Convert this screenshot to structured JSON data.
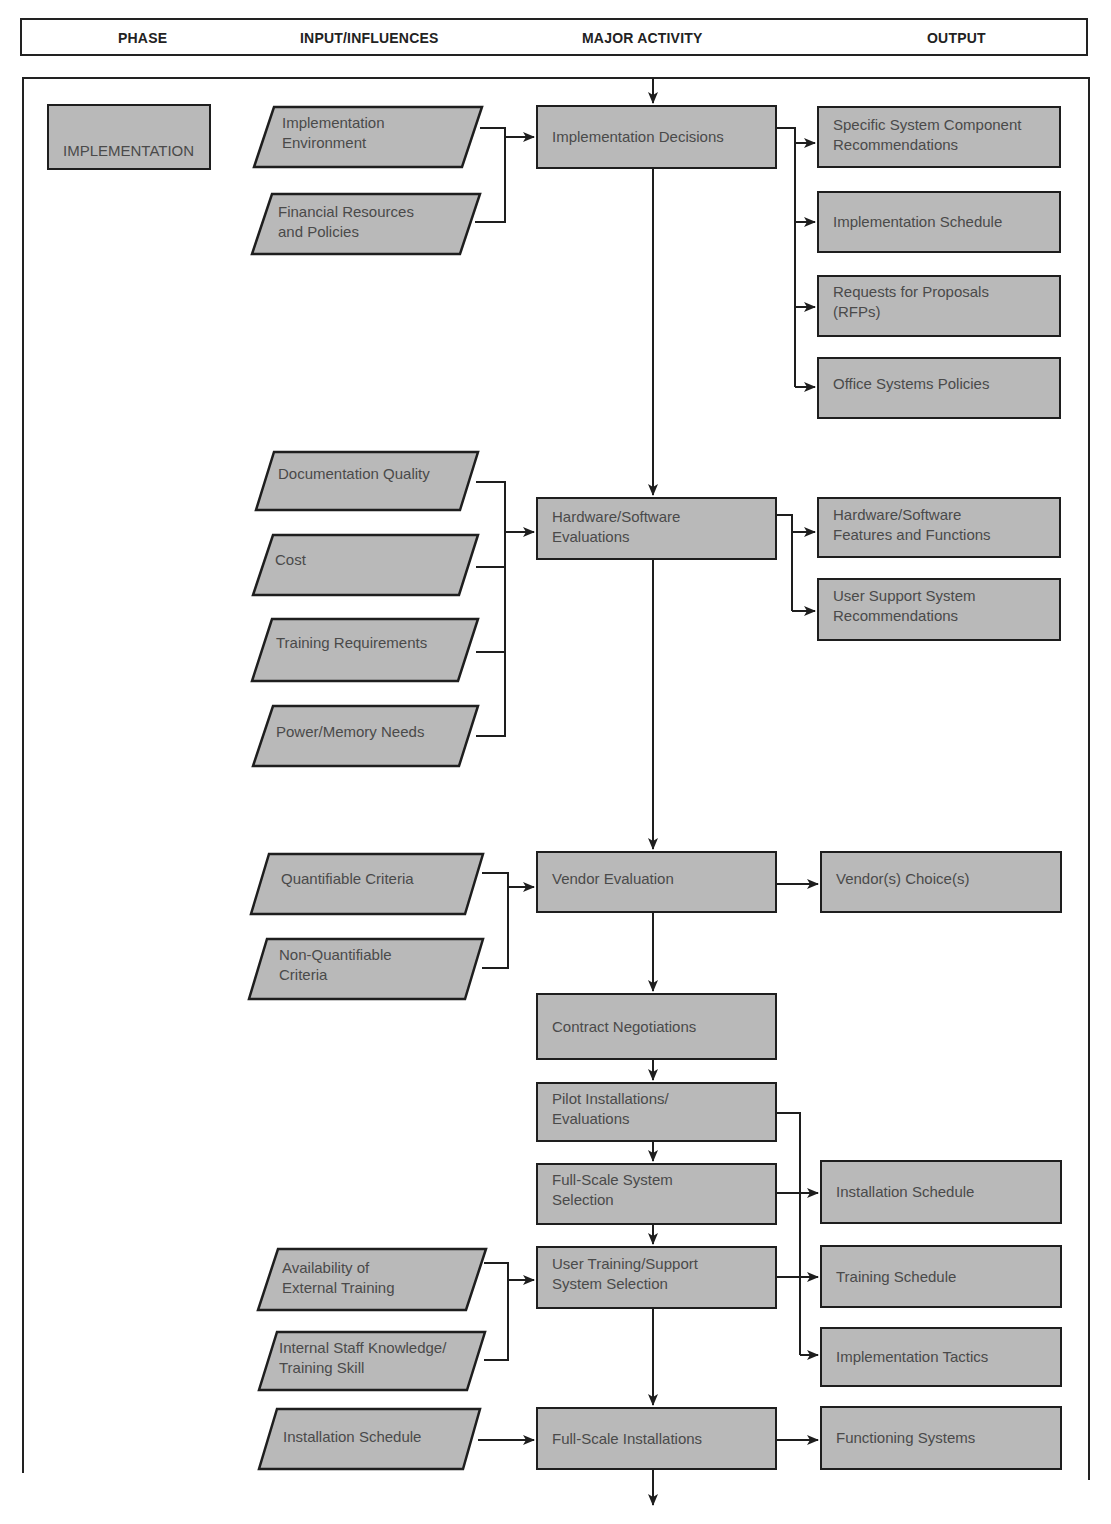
{
  "header": {
    "phase": "PHASE",
    "inputs": "INPUT/INFLUENCES",
    "activity": "MAJOR ACTIVITY",
    "output": "OUTPUT"
  },
  "phase_label": "IMPLEMENTATION",
  "colors": {
    "box_fill": "#b9b9b9",
    "stroke": "#1e1e1e",
    "text": "#4a4a4a"
  },
  "activities": [
    {
      "id": "implementation-decisions",
      "label": "Implementation Decisions"
    },
    {
      "id": "hardware-software-evaluations",
      "label": "Hardware/Software\nEvaluations"
    },
    {
      "id": "vendor-evaluation",
      "label": "Vendor Evaluation"
    },
    {
      "id": "contract-negotiations",
      "label": "Contract Negotiations"
    },
    {
      "id": "pilot-installations-evaluations",
      "label": "Pilot Installations/\nEvaluations"
    },
    {
      "id": "full-scale-system-selection",
      "label": "Full-Scale System\nSelection"
    },
    {
      "id": "user-training-support-system-selection",
      "label": "User Training/Support\nSystem Selection"
    },
    {
      "id": "full-scale-installations",
      "label": "Full-Scale Installations"
    }
  ],
  "inputs": [
    {
      "id": "implementation-environment",
      "label": "Implementation\nEnvironment"
    },
    {
      "id": "financial-resources-and-policies",
      "label": "Financial Resources\nand Policies"
    },
    {
      "id": "documentation-quality",
      "label": "Documentation Quality"
    },
    {
      "id": "cost",
      "label": "Cost"
    },
    {
      "id": "training-requirements",
      "label": "Training Requirements"
    },
    {
      "id": "power-memory-needs",
      "label": "Power/Memory Needs"
    },
    {
      "id": "quantifiable-criteria",
      "label": "Quantifiable Criteria"
    },
    {
      "id": "non-quantifiable-criteria",
      "label": "Non-Quantifiable\nCriteria"
    },
    {
      "id": "availability-of-external-training",
      "label": "Availability of\nExternal Training"
    },
    {
      "id": "internal-staff-knowledge",
      "label": "Internal Staff Knowledge/\nTraining  Skill"
    },
    {
      "id": "installation-schedule-input",
      "label": "Installation Schedule"
    }
  ],
  "outputs": [
    {
      "id": "specific-system-component-recommendations",
      "label": "Specific System Component\nRecommendations"
    },
    {
      "id": "implementation-schedule",
      "label": "Implementation Schedule"
    },
    {
      "id": "requests-for-proposals",
      "label": "Requests for Proposals\n(RFPs)"
    },
    {
      "id": "office-systems-policies",
      "label": "Office Systems Policies"
    },
    {
      "id": "hardware-software-features-and-functions",
      "label": "Hardware/Software\nFeatures and Functions"
    },
    {
      "id": "user-support-system-recommendations",
      "label": "User Support System\nRecommendations"
    },
    {
      "id": "vendors-choices",
      "label": "Vendor(s) Choice(s)"
    },
    {
      "id": "installation-schedule-output",
      "label": "Installation Schedule"
    },
    {
      "id": "training-schedule",
      "label": "Training Schedule"
    },
    {
      "id": "implementation-tactics",
      "label": "Implementation Tactics"
    },
    {
      "id": "functioning-systems",
      "label": "Functioning Systems"
    }
  ]
}
